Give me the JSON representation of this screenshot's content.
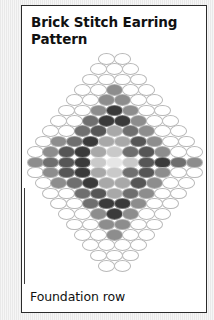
{
  "card": {
    "title": "Brick Stitch Earring Pattern",
    "foundation_label": "Foundation row",
    "border_color": "#2b2b2b",
    "background_color": "#ffffff"
  },
  "palette": {
    "empty": "#ffffff",
    "outline": "#b9b9b9",
    "lightest": "#e6e6e6",
    "light": "#c9c9c9",
    "mid_light": "#a8a8a8",
    "mid": "#8d8d8d",
    "mid_dark": "#6f6f6f",
    "dark": "#565656",
    "darkest": "#3a3a3a"
  },
  "chart_data": {
    "type": "grid",
    "title": "Brick Stitch Earring Pattern",
    "rows": 21,
    "max_row_width": 11,
    "legend": [
      "empty",
      "lightest",
      "light",
      "mid_light",
      "mid",
      "mid_dark",
      "dark",
      "darkest"
    ],
    "grid": [
      [
        0,
        0
      ],
      [
        0,
        0,
        0
      ],
      [
        0,
        0,
        0,
        0
      ],
      [
        0,
        0,
        4,
        0,
        0
      ],
      [
        0,
        0,
        4,
        4,
        0,
        0
      ],
      [
        0,
        0,
        4,
        7,
        4,
        0,
        0
      ],
      [
        0,
        0,
        5,
        7,
        7,
        4,
        0,
        0
      ],
      [
        0,
        0,
        5,
        6,
        3,
        5,
        4,
        0,
        0
      ],
      [
        0,
        4,
        5,
        7,
        3,
        3,
        6,
        4,
        0,
        0
      ],
      [
        0,
        4,
        6,
        7,
        3,
        2,
        5,
        6,
        4,
        0,
        0
      ],
      [
        4,
        5,
        6,
        7,
        2,
        1,
        2,
        6,
        7,
        5,
        4
      ],
      [
        0,
        4,
        6,
        7,
        3,
        2,
        5,
        6,
        4,
        0,
        0
      ],
      [
        0,
        4,
        5,
        7,
        3,
        3,
        6,
        4,
        0,
        0
      ],
      [
        0,
        0,
        5,
        6,
        3,
        5,
        4,
        0,
        0
      ],
      [
        0,
        0,
        5,
        7,
        7,
        4,
        0,
        0
      ],
      [
        0,
        0,
        4,
        7,
        4,
        0,
        0
      ],
      [
        0,
        0,
        4,
        4,
        0,
        0
      ],
      [
        0,
        0,
        4,
        0,
        0
      ],
      [
        0,
        0,
        0,
        0
      ],
      [
        0,
        0,
        0
      ],
      [
        0,
        0
      ]
    ]
  }
}
